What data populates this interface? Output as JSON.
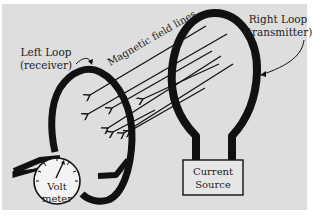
{
  "diagram": {
    "labels": {
      "left_loop_line1": "Left Loop",
      "left_loop_line2": "(receiver)",
      "right_loop_line1": "Right Loop",
      "right_loop_line2": "(transmitter)",
      "field_lines": "Magnetic field lines",
      "volt_meter_line1": "Volt",
      "volt_meter_line2": "meter",
      "current_source_line1": "Current",
      "current_source_line2": "Source"
    },
    "colors": {
      "background": "#dedede",
      "ink": "#111111"
    }
  }
}
